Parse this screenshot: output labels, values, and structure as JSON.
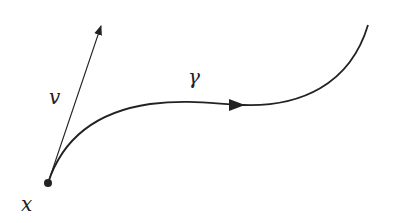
{
  "diagram": {
    "labels": {
      "point": "x",
      "vector": "v",
      "curve": "γ"
    },
    "colors": {
      "ink": "#222222",
      "background": "#ffffff"
    },
    "elements": [
      {
        "type": "point",
        "label": "x",
        "position": [
          48,
          183
        ]
      },
      {
        "type": "vector",
        "label": "v",
        "from": [
          48,
          183
        ],
        "to": [
          102,
          23
        ]
      },
      {
        "type": "curve",
        "label": "γ",
        "start": [
          48,
          183
        ],
        "end": [
          368,
          25
        ],
        "direction_arrow_at": [
          243,
          105
        ]
      }
    ]
  }
}
